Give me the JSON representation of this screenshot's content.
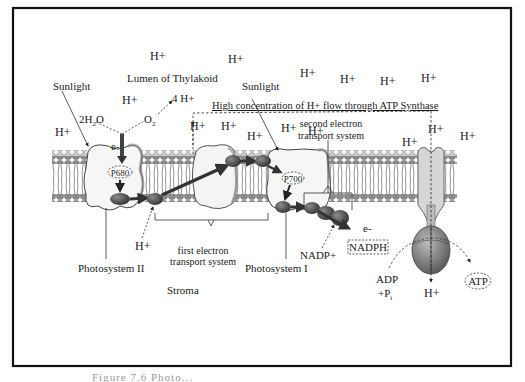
{
  "diagram": {
    "regions": {
      "lumen": "Lumen of Thylakoid",
      "stroma": "Stroma"
    },
    "labels": {
      "sunlight_left": "Sunlight",
      "sunlight_right": "Sunlight",
      "water": "2H",
      "water_sub": "2",
      "water_o": "O",
      "oxygen": "O",
      "oxygen_sub": "2",
      "four_h": "4 H+",
      "electron_top": "e-",
      "electron_bottom": "e-",
      "p680": "P680",
      "p700": "P700",
      "gradient_flow": "High concentration of H+ flow through ATP Synthase",
      "second_ets_line1": "second electron",
      "second_ets_line2": "transport system",
      "first_ets_line1": "first electron",
      "first_ets_line2": "transport system",
      "photosystem_ii": "Photosystem II",
      "photosystem_i": "Photosystem I",
      "nadp": "NADP+",
      "nadph": "NADPH",
      "adp": "ADP",
      "pi": "+P",
      "pi_sub": "i",
      "atp": "ATP",
      "h_plus": "H+",
      "h_stroma_left": "H+",
      "h_atp_out": "H+"
    },
    "h_ions_lumen": [
      {
        "x": 150,
        "y": 60
      },
      {
        "x": 228,
        "y": 63
      },
      {
        "x": 300,
        "y": 77
      },
      {
        "x": 340,
        "y": 83
      },
      {
        "x": 380,
        "y": 85
      },
      {
        "x": 421,
        "y": 82
      },
      {
        "x": 55,
        "y": 136
      },
      {
        "x": 122,
        "y": 104
      },
      {
        "x": 190,
        "y": 130
      },
      {
        "x": 221,
        "y": 130
      },
      {
        "x": 247,
        "y": 140
      },
      {
        "x": 281,
        "y": 132
      },
      {
        "x": 308,
        "y": 135
      },
      {
        "x": 402,
        "y": 146
      },
      {
        "x": 428,
        "y": 133
      },
      {
        "x": 460,
        "y": 140
      }
    ],
    "caption": "Figure 7.6 Photo..."
  },
  "colors": {
    "border": "#111111",
    "protein_fill": "#f4f4f4",
    "protein_stroke": "#555555",
    "head_fill": "#9a9a9a",
    "carrier_fill": "#4a4a4a",
    "atp_synthase": "#6f6f6f"
  }
}
